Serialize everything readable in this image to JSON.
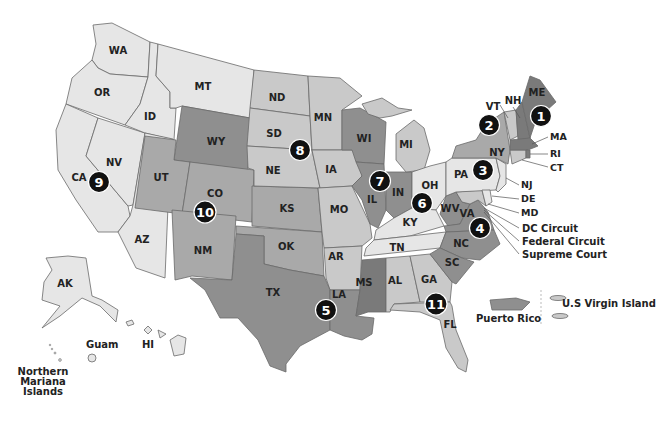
{
  "map": {
    "title": "",
    "legend_shades": {
      "light": "#e6e6e6",
      "medium_light": "#c9c9c9",
      "medium": "#a9a9a9",
      "medium_dark": "#8f8f8f",
      "dark": "#7a7a7a",
      "marker": "#111111"
    },
    "states": {
      "WA": "WA",
      "OR": "OR",
      "CA": "CA",
      "NV": "NV",
      "ID": "ID",
      "MT": "MT",
      "WY": "WY",
      "UT": "UT",
      "AZ": "AZ",
      "CO": "CO",
      "NM": "NM",
      "ND": "ND",
      "SD": "SD",
      "NE": "NE",
      "KS": "KS",
      "OK": "OK",
      "TX": "TX",
      "MN": "MN",
      "IA": "IA",
      "MO": "MO",
      "AR": "AR",
      "LA": "LA",
      "WI": "WI",
      "IL": "IL",
      "MI": "MI",
      "IN": "IN",
      "OH": "OH",
      "KY": "KY",
      "TN": "TN",
      "MS": "MS",
      "AL": "AL",
      "GA": "GA",
      "FL": "FL",
      "SC": "SC",
      "NC": "NC",
      "VA": "VA",
      "WV": "WV",
      "PA": "PA",
      "NY": "NY",
      "VT": "VT",
      "NH": "NH",
      "ME": "ME",
      "MA": "MA",
      "RI": "RI",
      "CT": "CT",
      "NJ": "NJ",
      "DE": "DE",
      "MD": "MD",
      "AK": "AK",
      "HI": "HI"
    },
    "circuits": [
      "1",
      "2",
      "3",
      "4",
      "5",
      "6",
      "7",
      "8",
      "9",
      "10",
      "11"
    ],
    "callouts": {
      "dc": "DC Circuit",
      "federal": "Federal Circuit",
      "supreme": "Supreme Court"
    },
    "territories": {
      "guam": "Guam",
      "nmi_line1": "Northern",
      "nmi_line2": "Mariana",
      "nmi_line3": "Islands",
      "pr": "Puerto Rico",
      "vi": "U.S Virgin Island"
    }
  }
}
